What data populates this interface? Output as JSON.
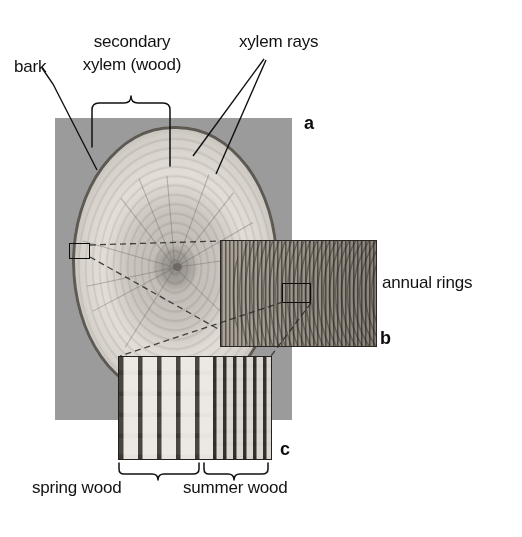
{
  "figure": {
    "background_color": "#ffffff",
    "mount_color": "#9b9b9b"
  },
  "labels": {
    "bark": "bark",
    "secondary_xylem_line1": "secondary",
    "secondary_xylem_line2": "xylem (wood)",
    "xylem_rays": "xylem rays",
    "annual_rings": "annual rings",
    "spring_wood": "spring wood",
    "summer_wood": "summer wood"
  },
  "panels": [
    {
      "letter": "a",
      "description": "whole trunk cross-section disc on grey mount"
    },
    {
      "letter": "b",
      "description": "magnified radial view showing annual rings"
    },
    {
      "letter": "c",
      "description": "magnified transverse view showing spring wood and summer wood cells"
    }
  ],
  "panel_letters": {
    "a": "a",
    "b": "b",
    "c": "c"
  }
}
